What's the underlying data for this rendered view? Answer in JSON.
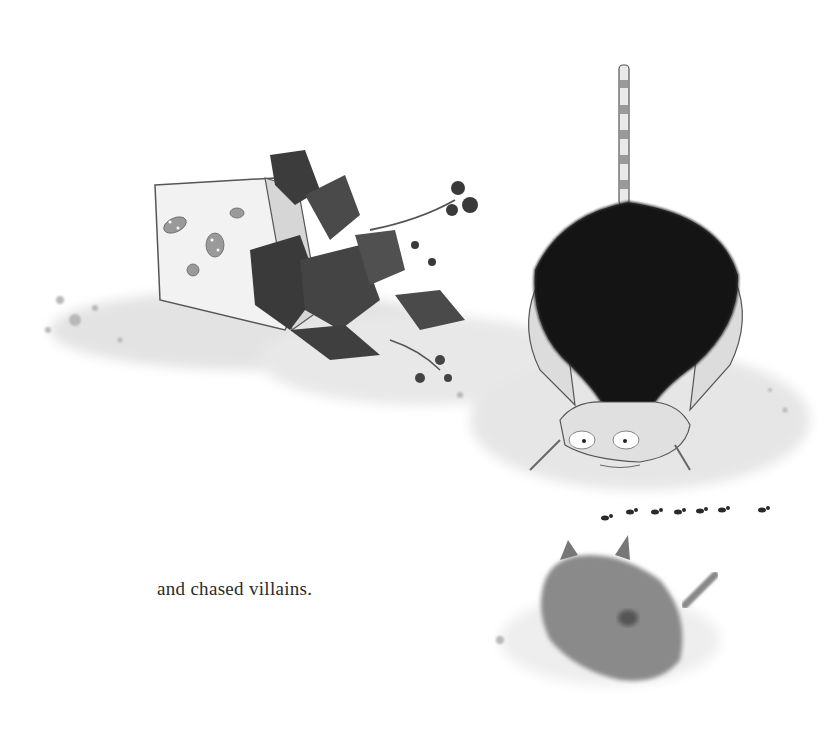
{
  "page": {
    "caption": "and chased villains.",
    "background": "#ffffff",
    "ink": "#1a1a1a"
  },
  "illustration": {
    "elements": [
      {
        "name": "toppled-flower-pot",
        "description": "overturned pot decorated with ladybugs"
      },
      {
        "name": "spilled-plant",
        "description": "plant with dark leaves and buds spilling from pot"
      },
      {
        "name": "crouching-cat",
        "description": "large black-furred cat with striped legs and tail, tail raised, stalking"
      },
      {
        "name": "ant-line",
        "description": "row of seven ants marching"
      },
      {
        "name": "fluffy-cat",
        "description": "small grey fluffy cat seen from behind"
      }
    ]
  }
}
